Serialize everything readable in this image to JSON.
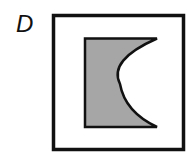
{
  "figure": {
    "label": "D",
    "outer_square": {
      "stroke": "#111111",
      "fill": "#ffffff"
    },
    "inner_shape": {
      "description": "rectangle with concave arc cut on right side",
      "fill": "#a6a6a6",
      "stroke": "#111111"
    }
  }
}
